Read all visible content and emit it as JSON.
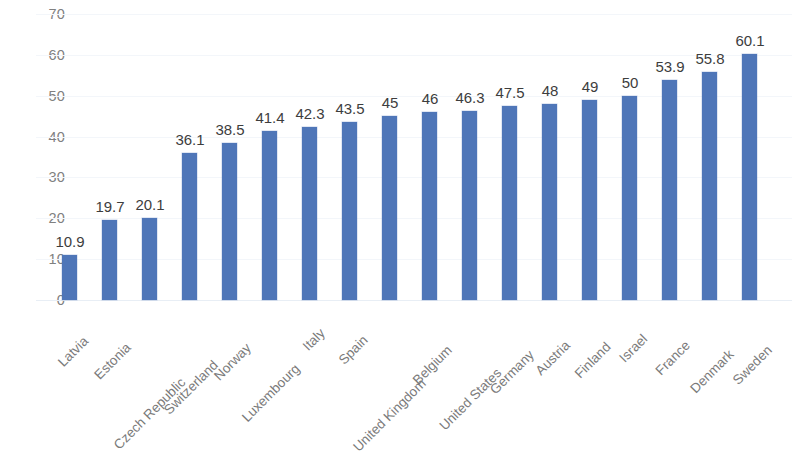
{
  "chart_data": {
    "type": "bar",
    "title": "",
    "subtitle": "",
    "xlabel": "",
    "ylabel": "",
    "ylim": [
      0,
      70
    ],
    "ytick_step": 10,
    "yticks": [
      0,
      10,
      20,
      30,
      40,
      50,
      60,
      70
    ],
    "ytick_labels": [
      "0",
      "10",
      "20",
      "30",
      "40",
      "50",
      "60",
      "70"
    ],
    "grid": true,
    "grid_axis": "y",
    "legend": false,
    "legend_position": "none",
    "bar_color": "#4f76b8",
    "data_label_color": "#3d3d3d",
    "tick_label_color": "#7a7a7a",
    "gridline_color": "#f3f6fa",
    "background_color": "#ffffff",
    "xtick_rotation": -45,
    "data_labels_shown": true,
    "categories": [
      "Latvia",
      "Estonia",
      "Czech Republic",
      "Switzerland",
      "Norway",
      "Luxembourg",
      "Italy",
      "Spain",
      "United Kingdom",
      "Belgium",
      "United States",
      "Germany",
      "Austria",
      "Finland",
      "Israel",
      "France",
      "Denmark",
      "Sweden"
    ],
    "values": [
      10.9,
      19.7,
      20.1,
      36.1,
      38.5,
      41.4,
      42.3,
      43.5,
      45,
      46,
      46.3,
      47.5,
      48,
      49,
      50,
      53.9,
      55.8,
      60.1
    ],
    "value_labels": [
      "10.9",
      "19.7",
      "20.1",
      "36.1",
      "38.5",
      "41.4",
      "42.3",
      "43.5",
      "45",
      "46",
      "46.3",
      "47.5",
      "48",
      "49",
      "50",
      "53.9",
      "55.8",
      "60.1"
    ]
  }
}
